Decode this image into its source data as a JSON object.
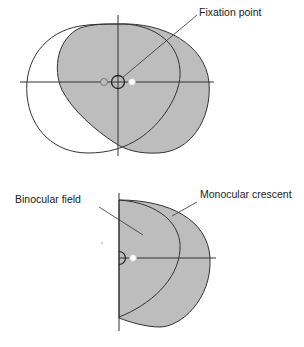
{
  "figure": {
    "top_diagram": {
      "name": "binocular-overlap-view",
      "label_fixation": "Fixation point"
    },
    "bottom_diagram": {
      "name": "hemifield-view",
      "label_binocular": "Binocular field",
      "label_monocular": "Monocular crescent"
    },
    "colors": {
      "field_fill": "#bdbdbd",
      "stroke": "#333333",
      "background": "#ffffff"
    }
  }
}
